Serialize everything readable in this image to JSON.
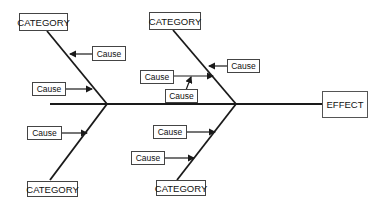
{
  "diagram": {
    "type": "fishbone",
    "effect": {
      "label": "EFFECT"
    },
    "categories": [
      {
        "position": "top-left",
        "label": "CATEGORY",
        "causes": [
          "Cause",
          "Cause"
        ]
      },
      {
        "position": "top-right",
        "label": "CATEGORY",
        "causes": [
          "Cause",
          "Cause",
          "Cause"
        ]
      },
      {
        "position": "bottom-left",
        "label": "CATEGORY",
        "causes": [
          "Cause"
        ]
      },
      {
        "position": "bottom-right",
        "label": "CATEGORY",
        "causes": [
          "Cause",
          "Cause"
        ]
      }
    ],
    "colors": {
      "line": "#1a1a1a",
      "box_border": "#444444",
      "background": "#ffffff"
    }
  }
}
